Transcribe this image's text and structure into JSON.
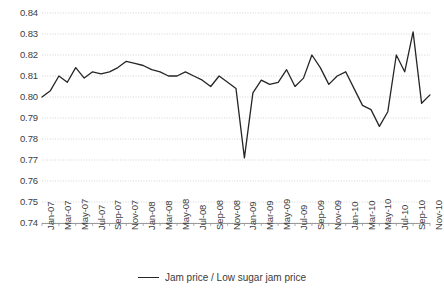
{
  "chart_data": {
    "type": "line",
    "title": "",
    "subtitle": "",
    "xlabel": "",
    "ylabel": "",
    "ylim": [
      0.74,
      0.84
    ],
    "ytick_step": 0.01,
    "yticks": [
      "0.84",
      "0.83",
      "0.82",
      "0.81",
      "0.80",
      "0.79",
      "0.78",
      "0.77",
      "0.76",
      "0.75",
      "0.74"
    ],
    "grid": true,
    "grid_style": "dotted-horizontal",
    "legend_position": "bottom-center",
    "legend": [
      "Jam price / Low sugar jam price"
    ],
    "line_color": "#262626",
    "categories": [
      "Jan-07",
      "Feb-07",
      "Mar-07",
      "Apr-07",
      "May-07",
      "Jun-07",
      "Jul-07",
      "Aug-07",
      "Sep-07",
      "Oct-07",
      "Nov-07",
      "Dec-07",
      "Jan-08",
      "Feb-08",
      "Mar-08",
      "Apr-08",
      "May-08",
      "Jun-08",
      "Jul-08",
      "Aug-08",
      "Sep-08",
      "Oct-08",
      "Nov-08",
      "Dec-08",
      "Jan-09",
      "Feb-09",
      "Mar-09",
      "Apr-09",
      "May-09",
      "Jun-09",
      "Jul-09",
      "Aug-09",
      "Sep-09",
      "Oct-09",
      "Nov-09",
      "Dec-09",
      "Jan-10",
      "Feb-10",
      "Mar-10",
      "Apr-10",
      "May-10",
      "Jun-10",
      "Jul-10",
      "Aug-10",
      "Sep-10",
      "Oct-10",
      "Nov-10"
    ],
    "xtick_labels": [
      "Jan-07",
      "Mar-07",
      "May-07",
      "Jul-07",
      "Sep-07",
      "Nov-07",
      "Jan-08",
      "Mar-08",
      "May-08",
      "Jul-08",
      "Sep-08",
      "Nov-08",
      "Jan-09",
      "Mar-09",
      "May-09",
      "Jul-09",
      "Sep-09",
      "Nov-09",
      "Jan-10",
      "Mar-10",
      "May-10",
      "Jul-10",
      "Sep-10",
      "Nov-10"
    ],
    "series": [
      {
        "name": "Jam price / Low sugar jam price",
        "values": [
          0.8,
          0.803,
          0.81,
          0.807,
          0.814,
          0.809,
          0.812,
          0.811,
          0.812,
          0.814,
          0.817,
          0.816,
          0.815,
          0.813,
          0.812,
          0.81,
          0.81,
          0.812,
          0.81,
          0.808,
          0.805,
          0.81,
          0.807,
          0.804,
          0.771,
          0.802,
          0.808,
          0.806,
          0.807,
          0.813,
          0.805,
          0.809,
          0.82,
          0.814,
          0.806,
          0.81,
          0.812,
          0.804,
          0.796,
          0.794,
          0.786,
          0.793,
          0.82,
          0.812,
          0.831,
          0.797,
          0.801
        ]
      }
    ]
  }
}
